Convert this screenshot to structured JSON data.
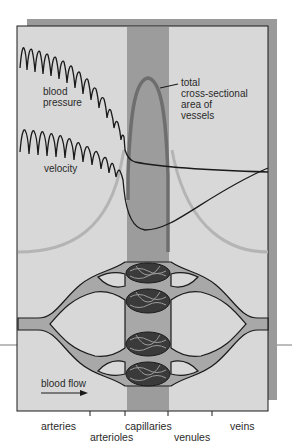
{
  "diagram": {
    "colors": {
      "panel_bg": "#d8d8d8",
      "panel_shadow": "#9a9a9a",
      "capillary_band": "#9c9c9c",
      "vessel_fill": "#a8a8a8",
      "curve_dark": "#1a1a1a",
      "curve_light": "#b0b0b0",
      "area_curve": "#6e6e6e"
    },
    "curve_labels": {
      "blood_pressure_line1": "blood",
      "blood_pressure_line2": "pressure",
      "velocity": "velocity",
      "area_line1": "total",
      "area_line2": "cross-sectional",
      "area_line3": "area of",
      "area_line4": "vessels"
    },
    "flow_label": "blood flow",
    "axis_labels": {
      "arteries": "arteries",
      "arterioles": "arterioles",
      "capillaries": "capillaries",
      "venules": "venules",
      "veins": "veins"
    }
  }
}
